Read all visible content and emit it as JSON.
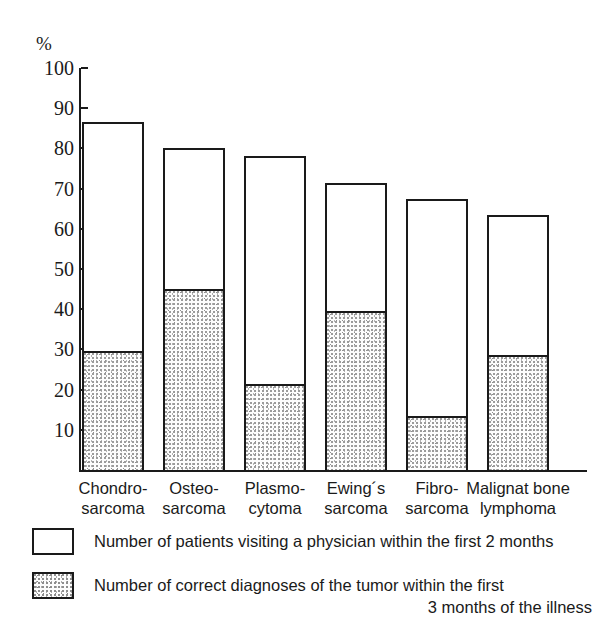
{
  "chart_data": {
    "type": "bar",
    "title": "",
    "subtitle": "",
    "xlabel": "",
    "ylabel": "%",
    "ylim": [
      0,
      100
    ],
    "grid": false,
    "stacked": true,
    "legend_position": "bottom",
    "categories": [
      "Chondro-\nsarcoma",
      "Osteo-\nsarcoma",
      "Plasmo-\ncytoma",
      "Ewing´s\nsarcoma",
      "Fibro-\nsarcoma",
      "Malignat bone\nlymphoma"
    ],
    "category_lines": [
      [
        "Chondro-",
        "sarcoma"
      ],
      [
        "Osteo-",
        "sarcoma"
      ],
      [
        "Plasmo-",
        "cytoma"
      ],
      [
        "Ewing´s",
        "sarcoma"
      ],
      [
        "Fibro-",
        "sarcoma"
      ],
      [
        "Malignat bone",
        "lymphoma"
      ]
    ],
    "series": [
      {
        "name": "Number of patients visiting a physician within the first 2 months",
        "fill": "white",
        "values": [
          86.5,
          80.0,
          78.0,
          71.5,
          67.5,
          63.5
        ]
      },
      {
        "name": "Number of correct diagnoses of the tumor within the first 3 months of the illness",
        "fill": "stipple",
        "values": [
          29.5,
          45.0,
          21.5,
          39.5,
          13.5,
          28.5
        ]
      }
    ],
    "y_ticks": [
      10,
      20,
      30,
      40,
      50,
      60,
      70,
      80,
      90,
      100
    ],
    "y_tick_labels": [
      "10",
      "20",
      "30",
      "40",
      "50",
      "60",
      "70",
      "80",
      "90",
      "100"
    ]
  },
  "legend": {
    "items": [
      {
        "swatch": "white-box",
        "line1": "Number of patients visiting a physician within the first 2 months",
        "line2": ""
      },
      {
        "swatch": "stippled-box",
        "line1": "Number of correct diagnoses of the tumor within the first",
        "line2": "3 months of the illness"
      }
    ]
  },
  "colors": {
    "ink": "#1a1a1a",
    "background": "#ffffff",
    "stipple": "#9b9b9b"
  }
}
